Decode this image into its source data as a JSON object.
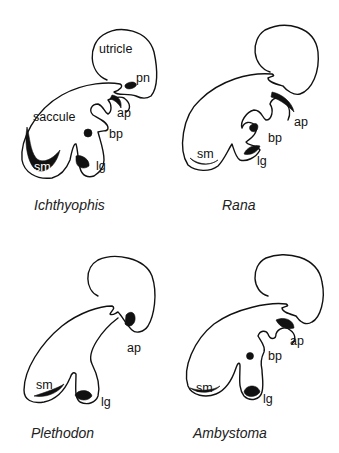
{
  "panels": [
    {
      "genus": "Ichthyophis",
      "labels": {
        "utricle": "utricle",
        "pn": "pn",
        "ap": "ap",
        "saccule": "saccule",
        "bp": "bp",
        "sm": "sm",
        "lg": "lg"
      }
    },
    {
      "genus": "Rana",
      "labels": {
        "ap": "ap",
        "bp": "bp",
        "sm": "sm",
        "lg": "lg"
      }
    },
    {
      "genus": "Plethodon",
      "labels": {
        "ap": "ap",
        "sm": "sm",
        "lg": "lg"
      }
    },
    {
      "genus": "Ambystoma",
      "labels": {
        "ap": "ap",
        "bp": "bp",
        "sm": "sm",
        "lg": "lg"
      }
    }
  ],
  "colors": {
    "line": "#111111",
    "background": "#ffffff"
  }
}
